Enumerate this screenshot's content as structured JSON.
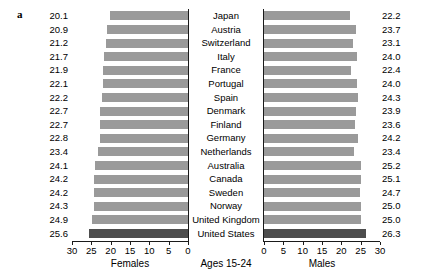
{
  "panel": {
    "letter": "a"
  },
  "chart_data": {
    "type": "bar",
    "orientation": "horizontal",
    "layout": "diverging-pyramid",
    "title": "",
    "center_label": "Ages 15-24",
    "categories": [
      "Japan",
      "Austria",
      "Switzerland",
      "Italy",
      "France",
      "Portugal",
      "Spain",
      "Denmark",
      "Finland",
      "Germany",
      "Netherlands",
      "Australia",
      "Canada",
      "Sweden",
      "Norway",
      "United Kingdom",
      "United States"
    ],
    "series": [
      {
        "name": "Females",
        "axis": "left",
        "xlabel": "Females",
        "xlim": [
          30,
          0
        ],
        "xticks": [
          30,
          25,
          20,
          15,
          10,
          5,
          0
        ],
        "values": [
          20.1,
          20.9,
          21.2,
          21.7,
          21.9,
          22.1,
          22.2,
          22.7,
          22.7,
          22.8,
          23.4,
          24.1,
          24.2,
          24.2,
          24.3,
          24.9,
          25.6
        ]
      },
      {
        "name": "Males",
        "axis": "right",
        "xlabel": "Males",
        "xlim": [
          0,
          30
        ],
        "xticks": [
          0,
          5,
          10,
          15,
          20,
          25,
          30
        ],
        "values": [
          22.2,
          23.7,
          23.1,
          24.0,
          22.4,
          24.0,
          24.3,
          23.9,
          23.6,
          24.2,
          23.4,
          25.2,
          25.1,
          24.7,
          25.0,
          25.0,
          26.3
        ]
      }
    ],
    "highlight_category": "United States",
    "grid": false,
    "legend": "none",
    "colors": {
      "bar": "#9a9a9a",
      "bar_highlight": "#4d4d4d",
      "axis": "#1a1a1a",
      "text": "#000000"
    }
  }
}
